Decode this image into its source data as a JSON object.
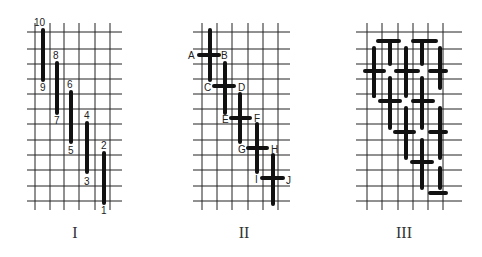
{
  "figure": {
    "panels": [
      {
        "id": "I",
        "caption": "I",
        "grid": {
          "x0": 27,
          "x1": 122,
          "y0": 23,
          "y1": 210,
          "vlines": [
            35,
            50,
            64,
            79,
            95,
            110
          ],
          "hlines": [
            32,
            49,
            64,
            79,
            94,
            109,
            124,
            140,
            155,
            170,
            186,
            201
          ]
        },
        "stitches": [
          {
            "x1": 43,
            "y1": 30,
            "x2": 43,
            "y2": 80
          },
          {
            "x1": 57,
            "y1": 63,
            "x2": 57,
            "y2": 113
          },
          {
            "x1": 71,
            "y1": 92,
            "x2": 71,
            "y2": 142
          },
          {
            "x1": 87,
            "y1": 123,
            "x2": 87,
            "y2": 172
          },
          {
            "x1": 104,
            "y1": 153,
            "x2": 104,
            "y2": 203
          }
        ],
        "labels": [
          {
            "text": "10",
            "x": 34,
            "y": 26
          },
          {
            "text": "9",
            "x": 40,
            "y": 91
          },
          {
            "text": "8",
            "x": 53,
            "y": 59
          },
          {
            "text": "7",
            "x": 54,
            "y": 124
          },
          {
            "text": "6",
            "x": 67,
            "y": 88
          },
          {
            "text": "5",
            "x": 68,
            "y": 154
          },
          {
            "text": "4",
            "x": 84,
            "y": 119
          },
          {
            "text": "3",
            "x": 84,
            "y": 185
          },
          {
            "text": "2",
            "x": 101,
            "y": 149
          },
          {
            "text": "1",
            "x": 101,
            "y": 214
          }
        ]
      },
      {
        "id": "II",
        "caption": "II",
        "grid": {
          "x0": 193,
          "x1": 290,
          "y0": 23,
          "y1": 210,
          "vlines": [
            202,
            217,
            232,
            248,
            263,
            278
          ],
          "hlines": [
            32,
            49,
            64,
            79,
            94,
            109,
            124,
            140,
            155,
            170,
            186,
            201
          ]
        },
        "stitches": [
          {
            "x1": 210,
            "y1": 30,
            "x2": 210,
            "y2": 80
          },
          {
            "x1": 225,
            "y1": 63,
            "x2": 225,
            "y2": 113
          },
          {
            "x1": 240,
            "y1": 94,
            "x2": 240,
            "y2": 142
          },
          {
            "x1": 257,
            "y1": 124,
            "x2": 257,
            "y2": 172
          },
          {
            "x1": 273,
            "y1": 155,
            "x2": 273,
            "y2": 204
          },
          {
            "x1": 199,
            "y1": 55,
            "x2": 219,
            "y2": 55
          },
          {
            "x1": 214,
            "y1": 86,
            "x2": 234,
            "y2": 86
          },
          {
            "x1": 231,
            "y1": 118,
            "x2": 250,
            "y2": 118
          },
          {
            "x1": 248,
            "y1": 148,
            "x2": 267,
            "y2": 148
          },
          {
            "x1": 262,
            "y1": 178,
            "x2": 283,
            "y2": 178
          }
        ],
        "labels": [
          {
            "text": "A",
            "x": 188,
            "y": 59
          },
          {
            "text": "B",
            "x": 221,
            "y": 59
          },
          {
            "text": "C",
            "x": 204,
            "y": 91
          },
          {
            "text": "D",
            "x": 238,
            "y": 91
          },
          {
            "text": "E",
            "x": 222,
            "y": 123
          },
          {
            "text": "F",
            "x": 254,
            "y": 122
          },
          {
            "text": "G",
            "x": 238,
            "y": 153
          },
          {
            "text": "H",
            "x": 271,
            "y": 153
          },
          {
            "text": "I",
            "x": 255,
            "y": 183
          },
          {
            "text": "J",
            "x": 286,
            "y": 184
          }
        ]
      },
      {
        "id": "III",
        "caption": "III",
        "grid": {
          "x0": 356,
          "x1": 462,
          "y0": 23,
          "y1": 210,
          "vlines": [
            367,
            382,
            398,
            413,
            428,
            443
          ],
          "hlines": [
            32,
            49,
            64,
            79,
            94,
            109,
            124,
            140,
            155,
            170,
            186,
            201
          ]
        },
        "stitches": [
          {
            "x1": 378,
            "y1": 41,
            "x2": 399,
            "y2": 41
          },
          {
            "x1": 413,
            "y1": 41,
            "x2": 436,
            "y2": 41
          },
          {
            "x1": 365,
            "y1": 71,
            "x2": 384,
            "y2": 71
          },
          {
            "x1": 396,
            "y1": 71,
            "x2": 418,
            "y2": 71
          },
          {
            "x1": 430,
            "y1": 71,
            "x2": 446,
            "y2": 71
          },
          {
            "x1": 380,
            "y1": 101,
            "x2": 400,
            "y2": 101
          },
          {
            "x1": 413,
            "y1": 101,
            "x2": 433,
            "y2": 101
          },
          {
            "x1": 395,
            "y1": 132,
            "x2": 414,
            "y2": 132
          },
          {
            "x1": 430,
            "y1": 132,
            "x2": 446,
            "y2": 132
          },
          {
            "x1": 412,
            "y1": 162,
            "x2": 432,
            "y2": 162
          },
          {
            "x1": 430,
            "y1": 193,
            "x2": 446,
            "y2": 193
          },
          {
            "x1": 374,
            "y1": 48,
            "x2": 374,
            "y2": 96
          },
          {
            "x1": 390,
            "y1": 41,
            "x2": 390,
            "y2": 64
          },
          {
            "x1": 406,
            "y1": 48,
            "x2": 406,
            "y2": 80
          },
          {
            "x1": 422,
            "y1": 41,
            "x2": 422,
            "y2": 64
          },
          {
            "x1": 440,
            "y1": 48,
            "x2": 440,
            "y2": 88
          },
          {
            "x1": 374,
            "y1": 71,
            "x2": 374,
            "y2": 96
          },
          {
            "x1": 390,
            "y1": 78,
            "x2": 390,
            "y2": 128
          },
          {
            "x1": 406,
            "y1": 71,
            "x2": 406,
            "y2": 96
          },
          {
            "x1": 422,
            "y1": 78,
            "x2": 422,
            "y2": 128
          },
          {
            "x1": 406,
            "y1": 108,
            "x2": 406,
            "y2": 158
          },
          {
            "x1": 440,
            "y1": 108,
            "x2": 440,
            "y2": 158
          },
          {
            "x1": 422,
            "y1": 140,
            "x2": 422,
            "y2": 188
          },
          {
            "x1": 440,
            "y1": 168,
            "x2": 440,
            "y2": 188
          }
        ],
        "labels": []
      }
    ]
  }
}
